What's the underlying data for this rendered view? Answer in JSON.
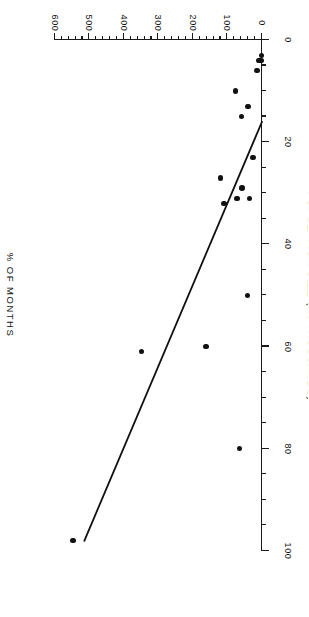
{
  "figure": {
    "rotation_degrees": 180,
    "background_color": "#ffffff",
    "ink_color": "#111111"
  },
  "axes": {
    "x_title": "POPULATION SIZE  (IN THOUSANDS)",
    "y_title": "%  OF  MONTHS",
    "x_tick_labels": [
      "0",
      "100",
      "200",
      "300",
      "400",
      "500",
      "600"
    ],
    "y_tick_labels": [
      "0",
      "20",
      "40",
      "60",
      "80",
      "100"
    ]
  },
  "chart_data": {
    "type": "scatter",
    "title": "",
    "subtitle": "",
    "xlabel": "POPULATION SIZE  (IN THOUSANDS)",
    "ylabel": "%  OF  MONTHS",
    "xlim": [
      0,
      600
    ],
    "ylim": [
      0,
      100
    ],
    "x_ticks": [
      0,
      100,
      200,
      300,
      400,
      500,
      600
    ],
    "y_ticks": [
      0,
      20,
      40,
      60,
      80,
      100
    ],
    "x_minor_tick_step": 20,
    "y_minor_tick_step": 5,
    "grid": false,
    "legend": null,
    "marker": "filled-circle",
    "marker_color": "#111111",
    "points": [
      {
        "x": 548,
        "y": 98
      },
      {
        "x": 350,
        "y": 61
      },
      {
        "x": 162,
        "y": 60
      },
      {
        "x": 120,
        "y": 27
      },
      {
        "x": 110,
        "y": 32
      },
      {
        "x": 76,
        "y": 10
      },
      {
        "x": 72,
        "y": 31
      },
      {
        "x": 66,
        "y": 80
      },
      {
        "x": 60,
        "y": 15
      },
      {
        "x": 58,
        "y": 29
      },
      {
        "x": 42,
        "y": 50
      },
      {
        "x": 40,
        "y": 13
      },
      {
        "x": 36,
        "y": 31
      },
      {
        "x": 26,
        "y": 23
      },
      {
        "x": 14,
        "y": 6
      },
      {
        "x": 9,
        "y": 4
      },
      {
        "x": 7,
        "y": 4
      },
      {
        "x": 5,
        "y": 4
      },
      {
        "x": 3,
        "y": 4
      },
      {
        "x": 2,
        "y": 3
      }
    ],
    "fit_line": {
      "type": "linear-regression",
      "x_start": 0,
      "y_start": 16,
      "x_end": 515,
      "y_end": 98,
      "color": "#111111",
      "width_px": 1.8
    }
  }
}
